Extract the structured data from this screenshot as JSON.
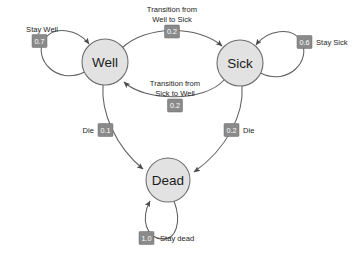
{
  "diagram": {
    "type": "markov-chain-state-diagram",
    "background_color": "#ffffff",
    "node_fill": "#e2e2e2",
    "node_stroke": "#6f6f6f",
    "edge_color": "#5f5f5f",
    "badge_fill": "#8a8a8a",
    "badge_text_color": "#ffffff",
    "states": [
      {
        "id": "well",
        "label": "Well",
        "cx": 105,
        "cy": 62,
        "r": 23
      },
      {
        "id": "sick",
        "label": "Sick",
        "cx": 240,
        "cy": 63,
        "r": 23
      },
      {
        "id": "dead",
        "label": "Dead",
        "cx": 168,
        "cy": 180,
        "r": 22
      }
    ],
    "transitions": [
      {
        "id": "well-to-well",
        "from": "well",
        "to": "well",
        "kind": "self-loop",
        "probability": "0.7",
        "caption": "Stay Well",
        "caption_lines": [
          "Stay Well"
        ]
      },
      {
        "id": "well-to-sick",
        "from": "well",
        "to": "sick",
        "kind": "arc",
        "probability": "0.2",
        "caption": "Transition from Well to Sick",
        "caption_lines": [
          "Transition from",
          "Well to Sick"
        ]
      },
      {
        "id": "sick-to-sick",
        "from": "sick",
        "to": "sick",
        "kind": "self-loop",
        "probability": "0.6",
        "caption": "Stay Sick",
        "caption_lines": [
          "Stay Sick"
        ]
      },
      {
        "id": "sick-to-well",
        "from": "sick",
        "to": "well",
        "kind": "arc",
        "probability": "0.2",
        "caption": "Transition from Sick to Well",
        "caption_lines": [
          "Transition from",
          "Sick to Well"
        ]
      },
      {
        "id": "well-to-dead",
        "from": "well",
        "to": "dead",
        "kind": "arc",
        "probability": "0.1",
        "caption": "Die",
        "caption_lines": [
          "Die"
        ]
      },
      {
        "id": "sick-to-dead",
        "from": "sick",
        "to": "dead",
        "kind": "arc",
        "probability": "0.2",
        "caption": "Die",
        "caption_lines": [
          "Die"
        ]
      },
      {
        "id": "dead-to-dead",
        "from": "dead",
        "to": "dead",
        "kind": "self-loop",
        "probability": "1.0",
        "caption": "Stay dead",
        "caption_lines": [
          "Stay dead"
        ]
      }
    ]
  }
}
